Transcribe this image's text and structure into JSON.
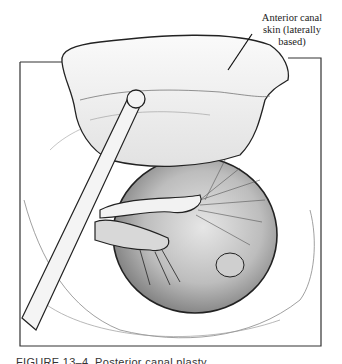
{
  "figure": {
    "annotation_label": "Anterior canal skin (laterally based)",
    "annotation_lines": [
      "Anterior canal",
      "skin (laterally",
      "based)"
    ],
    "caption": "FIGURE 13–4. Posterior canal plasty",
    "ink_color": "#1a1a1a",
    "background": "#ffffff"
  }
}
